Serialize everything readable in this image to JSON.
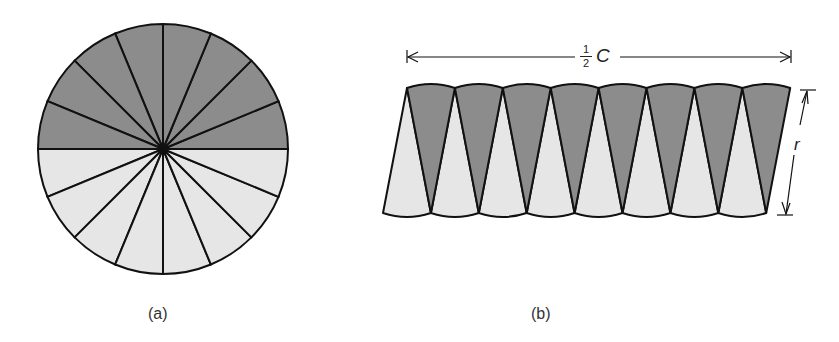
{
  "figure_a": {
    "caption": "(a)",
    "sectors": 16,
    "colors": {
      "dark": "#8c8c8c",
      "light": "#e6e6e6",
      "stroke": "#111111"
    }
  },
  "figure_b": {
    "caption": "(b)",
    "width_label_num": "1",
    "width_label_den": "2",
    "width_label_var": "C",
    "height_label": "r",
    "wedge_pairs": 8
  }
}
